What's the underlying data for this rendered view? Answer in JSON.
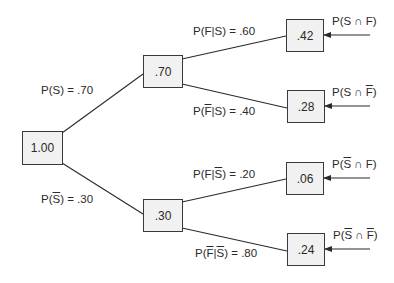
{
  "diagram": {
    "type": "probability-tree",
    "root": {
      "value": "1.00"
    },
    "level1": [
      {
        "value": ".70",
        "branch_label": "P(S) = .70",
        "event": "S"
      },
      {
        "value": ".30",
        "branch_label": "P(S̅) = .30",
        "event": "not S"
      }
    ],
    "level2": [
      {
        "value": ".42",
        "branch_label": "P(F|S) = .60",
        "joint_label": "P(S ∩ F)"
      },
      {
        "value": ".28",
        "branch_label": "P(F̅|S) = .40",
        "joint_label": "P(S ∩ F̅)"
      },
      {
        "value": ".06",
        "branch_label": "P(F|S̅) = .20",
        "joint_label": "P(S̅ ∩ F)"
      },
      {
        "value": ".24",
        "branch_label": "P(F̅|S̅) = .80",
        "joint_label": "P(S̅ ∩ F̅)"
      }
    ],
    "text": {
      "p_open": "P(",
      "close": ")",
      "S": "S",
      "F": "F",
      "bar": "|",
      "cap": " ∩ ",
      "eq70": ") = .70",
      "eq30": ") = .30",
      "eq60": ") = .60",
      "eq40": ") = .40",
      "eq20": ") = .20",
      "eq80": ") = .80"
    }
  },
  "colors": {
    "node_fill": "#f1f1f1",
    "node_border": "#3a3a3a",
    "line": "#2a2a2a",
    "text": "#2a2a2a"
  }
}
